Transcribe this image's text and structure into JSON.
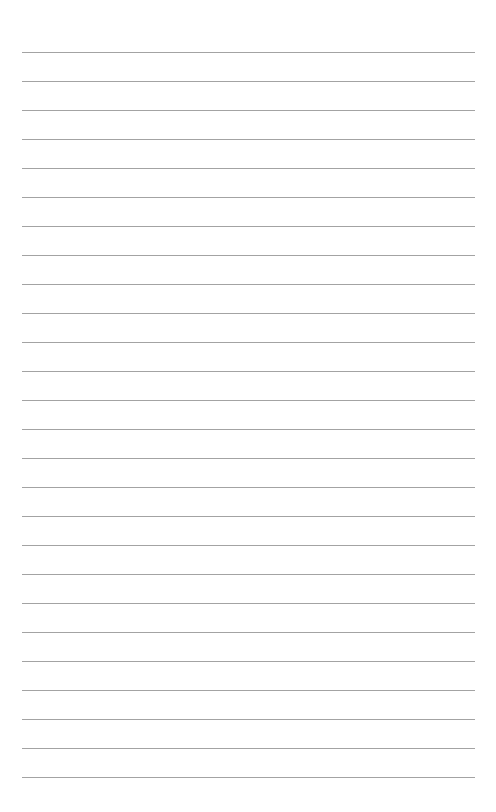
{
  "page": {
    "type": "lined-paper",
    "background_color": "#ffffff",
    "line_color": "#a3a3a3",
    "line_count": 26,
    "first_line_y": 52,
    "line_spacing": 29.0,
    "line_left": 22,
    "line_right": 475
  }
}
